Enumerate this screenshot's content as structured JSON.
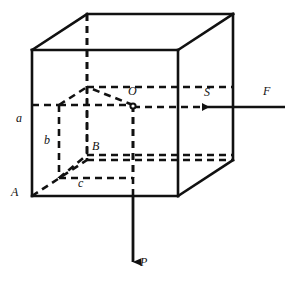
{
  "figure": {
    "kind": "geometry-diagram",
    "stroke_color": "#111111",
    "background_color": "#ffffff",
    "solid_line_width": 2.6,
    "dashed_line_width": 2.6,
    "dash_pattern": "7,5",
    "labels": [
      {
        "id": "a",
        "text": "a",
        "x": 16,
        "y": 118,
        "italic": true
      },
      {
        "id": "b",
        "text": "b",
        "x": 44,
        "y": 140,
        "italic": true
      },
      {
        "id": "c",
        "text": "c",
        "x": 78,
        "y": 183,
        "italic": true
      },
      {
        "id": "A",
        "text": "A",
        "x": 12,
        "y": 191,
        "italic": true
      },
      {
        "id": "B",
        "text": "B",
        "x": 92,
        "y": 146,
        "italic": true
      },
      {
        "id": "O",
        "text": "O",
        "x": 128,
        "y": 91,
        "italic": true
      },
      {
        "id": "S",
        "text": "S",
        "x": 204,
        "y": 92,
        "italic": true
      },
      {
        "id": "F",
        "text": "F",
        "x": 264,
        "y": 91,
        "italic": true
      },
      {
        "id": "P",
        "text": "P",
        "x": 140,
        "y": 262,
        "italic": true
      }
    ],
    "vertices": {
      "front_top_left": {
        "x": 32,
        "y": 50
      },
      "front_top_right": {
        "x": 178,
        "y": 50
      },
      "front_bottom_right": {
        "x": 178,
        "y": 196
      },
      "front_bottom_left": {
        "x": 32,
        "y": 196
      },
      "back_top_left": {
        "x": 87,
        "y": 14
      },
      "back_top_right": {
        "x": 233,
        "y": 14
      },
      "back_bottom_right": {
        "x": 233,
        "y": 160
      },
      "back_bottom_left": {
        "x": 87,
        "y": 160
      }
    },
    "inner_block": {
      "note": "dashed rectangular block inside the cube, corner A at front-bottom-left of cube",
      "front_top_left": {
        "x": 59,
        "y": 105
      },
      "front_top_right": {
        "x": 133,
        "y": 105
      },
      "front_bottom_right": {
        "x": 133,
        "y": 178
      },
      "front_bottom_left": {
        "x": 59,
        "y": 178
      },
      "back_top_left": {
        "x": 87,
        "y": 87
      },
      "back_bottom_left": {
        "x": 87,
        "y": 155
      }
    },
    "points": [
      {
        "id": "O",
        "x": 133,
        "y": 106,
        "marker": "open-circle",
        "radius": 2.6
      }
    ],
    "arrows": [
      {
        "id": "force-F",
        "label": "F",
        "direction": "left",
        "from": {
          "x": 285,
          "y": 107
        },
        "to": {
          "x": 200,
          "y": 107
        },
        "style": "solid"
      },
      {
        "id": "weight-P",
        "label": "P",
        "direction": "down",
        "from": {
          "x": 133,
          "y": 196
        },
        "to": {
          "x": 133,
          "y": 268
        },
        "style": "solid"
      }
    ]
  }
}
